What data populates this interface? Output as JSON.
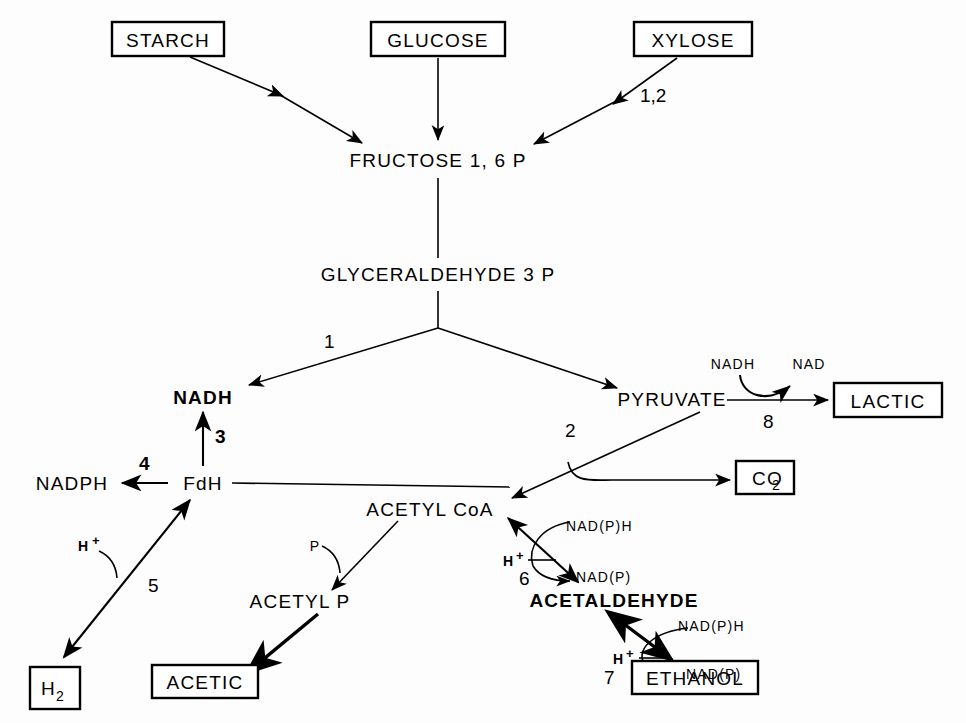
{
  "diagram": {
    "colors": {
      "ink": "#000000",
      "background": "#fdfdfd"
    },
    "boxed_nodes": [
      {
        "id": "starch",
        "label": "STARCH"
      },
      {
        "id": "glucose",
        "label": "GLUCOSE"
      },
      {
        "id": "xylose",
        "label": "XYLOSE"
      },
      {
        "id": "lactic",
        "label": "LACTIC"
      },
      {
        "id": "co2",
        "label": "CO",
        "sub": "2"
      },
      {
        "id": "h2",
        "label": "H",
        "sub": "2"
      },
      {
        "id": "acetic",
        "label": "ACETIC"
      },
      {
        "id": "ethanol",
        "label": "ETHANOL"
      }
    ],
    "plain_nodes": [
      {
        "id": "fructose16p",
        "label": "FRUCTOSE  1, 6 P"
      },
      {
        "id": "glyceraldehyde3p",
        "label": "GLYCERALDEHYDE 3 P"
      },
      {
        "id": "nadh",
        "label": "NADH"
      },
      {
        "id": "pyruvate",
        "label": "PYRUVATE"
      },
      {
        "id": "nadph",
        "label": "NADPH"
      },
      {
        "id": "fdh",
        "label": "FdH"
      },
      {
        "id": "acetyl_coa",
        "label": "ACETYL CoA"
      },
      {
        "id": "acetyl_p",
        "label": "ACETYL P"
      },
      {
        "id": "acetaldehyde",
        "label": "ACETALDEHYDE"
      }
    ],
    "cofactors": [
      {
        "id": "cof-nadh-lactic",
        "label": "NADH"
      },
      {
        "id": "cof-nad-lactic",
        "label": "NAD"
      },
      {
        "id": "cof-p-acetylp",
        "label": "P"
      },
      {
        "id": "cof-hplus-5",
        "label": "H",
        "sup": "+"
      },
      {
        "id": "cof-hplus-6",
        "label": "H",
        "sup": "+"
      },
      {
        "id": "cof-hplus-7",
        "label": "H",
        "sup": "+"
      },
      {
        "id": "cof-nadph-6",
        "label": "NAD(P)H"
      },
      {
        "id": "cof-nadp-6",
        "label": "NAD(P)"
      },
      {
        "id": "cof-nadph-7",
        "label": "NAD(P)H"
      },
      {
        "id": "cof-nadp-7",
        "label": "NAD(P)"
      }
    ],
    "step_labels": [
      {
        "id": "step-1-2",
        "label": "1,2",
        "on": "xylose-to-fructose"
      },
      {
        "id": "step-1",
        "label": "1",
        "on": "glyceraldehyde-to-nadh"
      },
      {
        "id": "step-2",
        "label": "2",
        "on": "pyruvate-to-acetylcoa"
      },
      {
        "id": "step-3",
        "label": "3",
        "on": "fdh-to-nadh"
      },
      {
        "id": "step-4",
        "label": "4",
        "on": "fdh-to-nadph"
      },
      {
        "id": "step-5",
        "label": "5",
        "on": "fdh-to-h2"
      },
      {
        "id": "step-6",
        "label": "6",
        "on": "acetylcoa-to-acetaldehyde"
      },
      {
        "id": "step-7",
        "label": "7",
        "on": "acetaldehyde-to-ethanol"
      },
      {
        "id": "step-8",
        "label": "8",
        "on": "pyruvate-to-lactic"
      }
    ]
  }
}
